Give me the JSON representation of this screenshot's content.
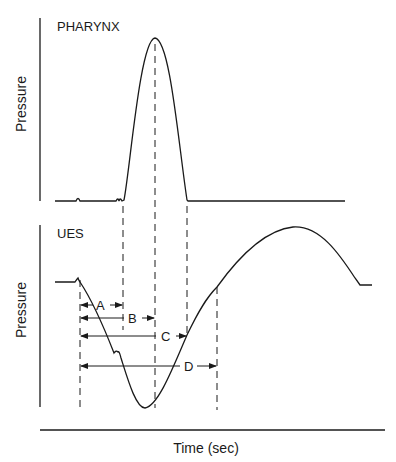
{
  "diagram": {
    "type": "pressure-time diagram",
    "top_panel": {
      "title": "PHARYNX",
      "ylabel": "Pressure"
    },
    "bottom_panel": {
      "title": "UES",
      "ylabel": "Pressure"
    },
    "xlabel": "Time (sec)",
    "intervals": [
      {
        "label": "A",
        "from": "UES relaxation onset",
        "to": "pharyngeal pressure onset"
      },
      {
        "label": "B",
        "from": "UES relaxation onset",
        "to": "pharyngeal peak"
      },
      {
        "label": "C",
        "from": "UES relaxation onset",
        "to": "end of pharyngeal contraction"
      },
      {
        "label": "D",
        "from": "UES relaxation onset",
        "to": "UES pressure recovery"
      }
    ],
    "colors": {
      "line": "#1a1a1a",
      "background": "#ffffff"
    }
  }
}
